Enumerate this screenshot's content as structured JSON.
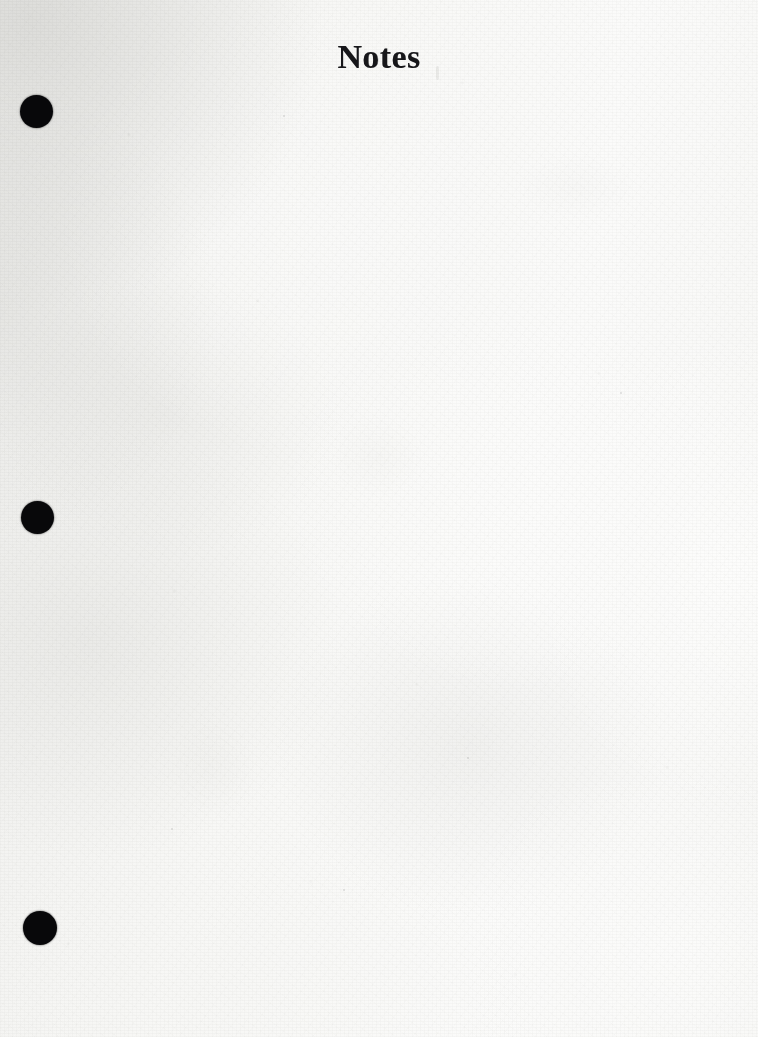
{
  "document": {
    "type": "scanned-notebook-page",
    "title": "Notes",
    "body_text": "",
    "page_width": 758,
    "page_height": 1037,
    "paper_color": "#f6f6f4",
    "ink_color": "#17171a"
  },
  "title": {
    "text": "Notes",
    "align": "center",
    "style": "serif-bold"
  },
  "holes": {
    "label": "binder-hole-punch",
    "color": "#08080a",
    "items": [
      {
        "name": "hole-top",
        "cx": 36,
        "cy": 111,
        "d": 33
      },
      {
        "name": "hole-middle",
        "cx": 37,
        "cy": 517,
        "d": 33
      },
      {
        "name": "hole-bottom",
        "cx": 40,
        "cy": 928,
        "d": 34
      }
    ]
  },
  "flecks": [
    {
      "x": 436,
      "y": 66,
      "w": 3,
      "h": 14
    },
    {
      "x": 283,
      "y": 115,
      "w": 2,
      "h": 2
    },
    {
      "x": 620,
      "y": 392,
      "w": 2,
      "h": 2
    },
    {
      "x": 467,
      "y": 757,
      "w": 2,
      "h": 2
    },
    {
      "x": 171,
      "y": 828,
      "w": 2,
      "h": 2
    },
    {
      "x": 343,
      "y": 889,
      "w": 2,
      "h": 2
    }
  ]
}
